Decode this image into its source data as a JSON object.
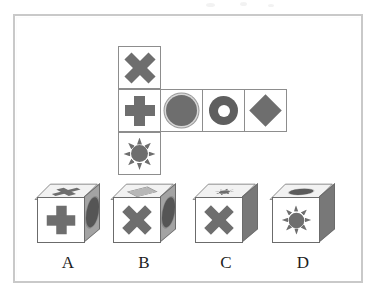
{
  "puzzle": {
    "type": "cube-folding-spatial-reasoning",
    "frame_border_color": "#c9c9c9",
    "background_color": "#ffffff",
    "shape_fill_color": "#6e6e6e",
    "cell_border_color": "#8d8d8d"
  },
  "net": {
    "description": "Unfolded cube net in T/cross arrangement: one cell on top row, four cells in the middle row, one cell on bottom row",
    "rows": 3,
    "columns": 4,
    "cell_size_px": 43,
    "cells": [
      {
        "id": "net-cell-top",
        "row": 0,
        "col": 0,
        "shape": "x",
        "shape_label": "X cross"
      },
      {
        "id": "net-cell-mid-1",
        "row": 1,
        "col": 0,
        "shape": "plus",
        "shape_label": "Plus cross"
      },
      {
        "id": "net-cell-mid-2",
        "row": 1,
        "col": 1,
        "shape": "disc",
        "shape_label": "Filled circle"
      },
      {
        "id": "net-cell-mid-3",
        "row": 1,
        "col": 2,
        "shape": "ring",
        "shape_label": "Ring / donut"
      },
      {
        "id": "net-cell-mid-4",
        "row": 1,
        "col": 3,
        "shape": "diamond",
        "shape_label": "Diamond"
      },
      {
        "id": "net-cell-bottom",
        "row": 2,
        "col": 0,
        "shape": "sun",
        "shape_label": "Sun / starburst"
      }
    ]
  },
  "answers": {
    "options": [
      {
        "label": "A",
        "front_shape": "plus",
        "front_shape_label": "Plus cross",
        "top_shape": "x",
        "top_shape_label": "X cross",
        "side_shape": "oval",
        "side_shape_label": "Dark oval",
        "side_shade": "light"
      },
      {
        "label": "B",
        "front_shape": "x",
        "front_shape_label": "X cross",
        "top_shape": "diamond",
        "top_shape_label": "Light diamond",
        "side_shape": "oval",
        "side_shape_label": "Dark oval",
        "side_shade": "light"
      },
      {
        "label": "C",
        "front_shape": "x",
        "front_shape_label": "X cross",
        "top_shape": "sun",
        "top_shape_label": "Sun / starburst",
        "side_shape": "none",
        "side_shape_label": "Plain dark side",
        "side_shade": "dark"
      },
      {
        "label": "D",
        "front_shape": "sun",
        "front_shape_label": "Sun / starburst",
        "top_shape": "oval",
        "top_shape_label": "Filled oval",
        "side_shape": "none",
        "side_shape_label": "Plain dark side",
        "side_shade": "dark"
      }
    ]
  }
}
